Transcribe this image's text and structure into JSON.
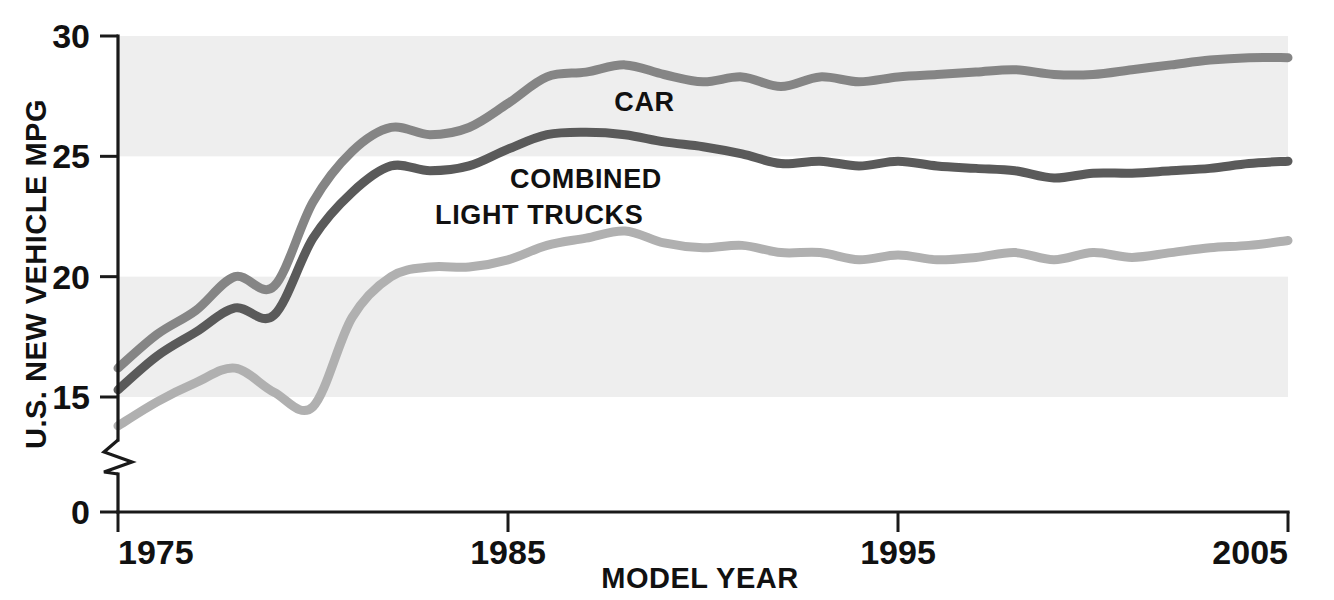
{
  "chart_data": {
    "type": "line",
    "title": "",
    "xlabel": "MODEL YEAR",
    "ylabel": "U.S. NEW VEHICLE MPG",
    "xlim": [
      1975,
      2005
    ],
    "ylim": [
      0,
      30
    ],
    "y_axis_break": true,
    "y_axis_break_note": "axis broken between 0 and 15",
    "grid": "horizontal-bands",
    "bands_shaded": [
      [
        15,
        20
      ],
      [
        25,
        30
      ]
    ],
    "legend_position": "inline-labels",
    "xticks": [
      1975,
      1985,
      1995,
      2005
    ],
    "xtick_labels": [
      "1975",
      "1985",
      "1995",
      "2005"
    ],
    "yticks": [
      0,
      15,
      20,
      25,
      30
    ],
    "ytick_labels": [
      "0",
      "15",
      "20",
      "25",
      "30"
    ],
    "x": [
      1975,
      1976,
      1977,
      1978,
      1979,
      1980,
      1981,
      1982,
      1983,
      1984,
      1985,
      1986,
      1987,
      1988,
      1989,
      1990,
      1991,
      1992,
      1993,
      1994,
      1995,
      1996,
      1997,
      1998,
      1999,
      2000,
      2001,
      2002,
      2003,
      2004,
      2005
    ],
    "series": [
      {
        "name": "CAR",
        "label": "CAR",
        "color": "#858585",
        "values": [
          16.2,
          17.6,
          18.6,
          20.0,
          19.6,
          23.1,
          25.2,
          26.2,
          25.9,
          26.2,
          27.2,
          28.3,
          28.5,
          28.8,
          28.4,
          28.1,
          28.3,
          27.9,
          28.3,
          28.1,
          28.3,
          28.4,
          28.5,
          28.6,
          28.4,
          28.4,
          28.6,
          28.8,
          29.0,
          29.1,
          29.1
        ]
      },
      {
        "name": "COMBINED",
        "label": "COMBINED",
        "color": "#5a5a5a",
        "values": [
          15.3,
          16.7,
          17.7,
          18.7,
          18.4,
          21.6,
          23.5,
          24.6,
          24.4,
          24.6,
          25.3,
          25.9,
          26.0,
          25.9,
          25.6,
          25.4,
          25.1,
          24.7,
          24.8,
          24.6,
          24.8,
          24.6,
          24.5,
          24.4,
          24.1,
          24.3,
          24.3,
          24.4,
          24.5,
          24.7,
          24.8
        ]
      },
      {
        "name": "LIGHT TRUCKS",
        "label": "LIGHT TRUCKS",
        "color": "#b0b0b0",
        "values": [
          13.8,
          14.8,
          15.6,
          16.2,
          15.2,
          14.6,
          18.3,
          20.0,
          20.4,
          20.4,
          20.7,
          21.3,
          21.6,
          21.9,
          21.4,
          21.2,
          21.3,
          21.0,
          21.0,
          20.7,
          20.9,
          20.7,
          20.8,
          21.0,
          20.7,
          21.0,
          20.8,
          21.0,
          21.2,
          21.3,
          21.5
        ]
      }
    ],
    "series_label_positions": [
      {
        "name": "CAR",
        "x": 1988.5,
        "y": 26.9
      },
      {
        "name": "COMBINED",
        "x": 1987.0,
        "y": 23.7
      },
      {
        "name": "LIGHT TRUCKS",
        "x": 1985.8,
        "y": 22.2
      }
    ]
  },
  "colors": {
    "background": "#ffffff",
    "band": "#eeeeee",
    "axis": "#1a1a1a",
    "car": "#858585",
    "combined": "#5a5a5a",
    "light_trucks": "#b0b0b0"
  }
}
